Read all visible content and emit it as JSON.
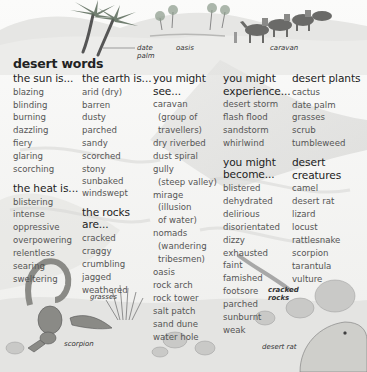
{
  "title": "desert words",
  "labels": {
    "date_palm": [
      "date",
      "palm"
    ],
    "oasis": "oasis",
    "caravan": "caravan",
    "grasses": "grasses",
    "scorpion": "scorpion",
    "cracked_rocks": [
      "cracked",
      "rocks"
    ],
    "desert_rat": "desert rat"
  },
  "columns": [
    {
      "sections": [
        {
          "heading": [
            "the sun is..."
          ],
          "items": [
            "blazing",
            "blinding",
            "burning",
            "dazzling",
            "fiery",
            "glaring",
            "scorching"
          ]
        },
        {
          "heading": [
            "the heat is..."
          ],
          "items": [
            "blistering",
            "intense",
            "oppressive",
            "overpowering",
            "relentless",
            "searing",
            "sweltering"
          ]
        }
      ]
    },
    {
      "sections": [
        {
          "heading": [
            "the earth is..."
          ],
          "items": [
            "arid (dry)",
            "barren",
            "dusty",
            "parched",
            "sandy",
            "scorched",
            "stony",
            "sunbaked",
            "windswept"
          ]
        },
        {
          "heading": [
            "the rocks",
            "are..."
          ],
          "items": [
            "cracked",
            "craggy",
            "crumbling",
            "jagged",
            "weathered"
          ]
        }
      ]
    },
    {
      "sections": [
        {
          "heading": [
            "you might",
            "see..."
          ],
          "items": [
            {
              "t": "caravan"
            },
            {
              "t": "(group of",
              "i": true
            },
            {
              "t": "travellers)",
              "i": true
            },
            {
              "t": "dry riverbed"
            },
            {
              "t": "dust spiral"
            },
            {
              "t": "gully"
            },
            {
              "t": "(steep valley)",
              "i": true
            },
            {
              "t": "mirage"
            },
            {
              "t": "(illusion",
              "i": true
            },
            {
              "t": "of water)",
              "i": true
            },
            {
              "t": "nomads"
            },
            {
              "t": "(wandering",
              "i": true
            },
            {
              "t": "tribesmen)",
              "i": true
            },
            {
              "t": "oasis"
            },
            {
              "t": "rock arch"
            },
            {
              "t": "rock tower"
            },
            {
              "t": "salt patch"
            },
            {
              "t": "sand dune"
            },
            {
              "t": "water hole"
            }
          ]
        }
      ]
    },
    {
      "sections": [
        {
          "heading": [
            "you might",
            "experience..."
          ],
          "items": [
            "desert storm",
            "flash flood",
            "sandstorm",
            "whirlwind"
          ]
        },
        {
          "heading": [
            "you might",
            "become..."
          ],
          "items": [
            "blistered",
            "dehydrated",
            "delirious",
            "disorientated",
            "dizzy",
            "exhausted",
            "faint",
            "famished",
            "footsore",
            "parched",
            "sunburnt",
            "weak"
          ]
        }
      ]
    },
    {
      "sections": [
        {
          "heading": [
            "desert plants"
          ],
          "items": [
            "cactus",
            "date palm",
            "grasses",
            "scrub",
            "tumbleweed"
          ]
        },
        {
          "heading": [
            "desert",
            "creatures"
          ],
          "items": [
            "camel",
            "desert rat",
            "lizard",
            "locust",
            "rattlesnake",
            "scorpion",
            "tarantula",
            "vulture"
          ]
        }
      ]
    }
  ]
}
